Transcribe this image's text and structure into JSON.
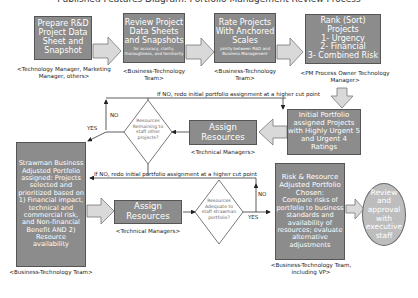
{
  "title": "Published Features Diagram: Portfolio Management Review Process",
  "colors": {
    "box_fill": "#8c8c8c",
    "box_border": "#555555",
    "arrow_fill": "#d9d9d9",
    "ellipse_fill": "#bdbdbd",
    "line": "#333333"
  },
  "steps": {
    "prepare": {
      "text": "Prepare R&D Project Data Sheet and Snapshot",
      "owner": "<Technology Manager, Marketing Manager, others>"
    },
    "review": {
      "text": "Review Project Data Sheets and Snapshots",
      "note": "for accuracy, clarity, thoroughness, and familiarity",
      "owner": "<Business-Technology Team>"
    },
    "rate": {
      "text": "Rate Projects With Anchored Scales",
      "note": "jointly between R&D and Business Management",
      "owner": "<Business-Technology Team>"
    },
    "rank": {
      "line1": "Rank (Sort)",
      "line2": "Projects",
      "line3": "1- Urgency",
      "line4": "2- Financial",
      "line5": "3- Combined Risk",
      "owner": "<PM Process Owner Technology Manager>"
    },
    "initial": {
      "text": "Initial Portfolio assigned Projects with Highly Urgent 5 and Urgent 4 Ratings",
      "owner": ""
    },
    "assign1": {
      "text": "Assign Resources",
      "owner": "<Technical Managers>"
    },
    "decision1": {
      "text": "Resources Remaining to staff other projects?",
      "no_label": "NO",
      "yes_label": "YES",
      "loop_note": "If NO, redo initial portfolio assignment at a higher cut point"
    },
    "strawman": {
      "text": "Strawman Business Adjusted Portfolio assigned: Projects selected and prioritized based on 1) Financial impact, technical and commercial risk, and Non-financial Benefit AND 2) Resource availability",
      "owner": "<Business-Technology Team>"
    },
    "assign2": {
      "text": "Assign Resources",
      "owner": "<Technical Managers>"
    },
    "decision2": {
      "text": "Resources Adequate to staff strawman portfolio?",
      "no_label": "NO",
      "yes_label": "YES",
      "loop_note": "If NO, redo initial portfolio assignment at a higher cut point"
    },
    "risk": {
      "title": "Risk & Resource Adjusted Portfolio Chosen:",
      "text": "Compare risks of portfolio to business standards and availability of resources; evaluate alternative adjustments",
      "owner": "<Business-Technology Team, including VP>"
    },
    "final": {
      "text": "Review and approval with executive staff"
    }
  }
}
